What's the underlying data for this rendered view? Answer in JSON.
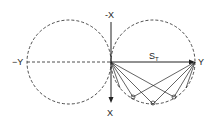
{
  "diagram": {
    "labels": {
      "neg_x": "-X",
      "pos_x": "X",
      "neg_y": "−Y",
      "pos_y": "Y",
      "vector": "S",
      "vector_sub": "T",
      "alpha": "α"
    },
    "colors": {
      "stroke": "#222222",
      "background": "#ffffff"
    }
  }
}
